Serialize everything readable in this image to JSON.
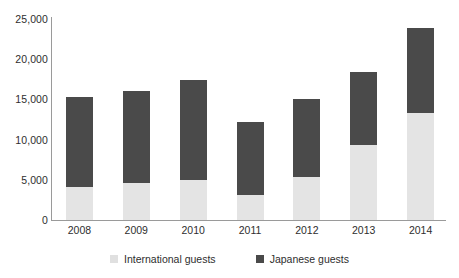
{
  "chart_data": {
    "type": "bar",
    "stacked": true,
    "title": "",
    "subtitle": "",
    "xlabel": "",
    "ylabel": "",
    "categories": [
      "2008",
      "2009",
      "2010",
      "2011",
      "2012",
      "2013",
      "2014"
    ],
    "series": [
      {
        "name": "International guests",
        "color": "#e4e4e4",
        "values": [
          4050,
          4550,
          5000,
          3150,
          5300,
          9350,
          13350
        ]
      },
      {
        "name": "Japanese guests",
        "color": "#4a4a4a",
        "values": [
          11300,
          11450,
          12450,
          9050,
          9700,
          9000,
          10500
        ]
      }
    ],
    "totals": [
      15350,
      16000,
      17450,
      12200,
      15000,
      18350,
      23850
    ],
    "ylim": [
      0,
      25000
    ],
    "yticks": [
      0,
      5000,
      10000,
      15000,
      20000,
      25000
    ],
    "ytick_labels": [
      "0",
      "5,000",
      "10,000",
      "15,000",
      "20,000",
      "25,000"
    ],
    "grid": false,
    "legend_position": "bottom"
  },
  "legend": {
    "items": [
      {
        "label": "International guests",
        "swatch": "light-gray-swatch-icon"
      },
      {
        "label": "Japanese guests",
        "swatch": "dark-gray-swatch-icon"
      }
    ]
  }
}
